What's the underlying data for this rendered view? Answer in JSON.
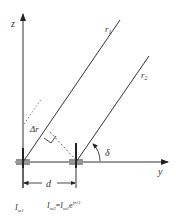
{
  "diagram": {
    "axes": {
      "vertical_label": "z",
      "horizontal_label": "y"
    },
    "rays": [
      {
        "label": "r",
        "subscript": "1"
      },
      {
        "label": "r",
        "subscript": "2"
      }
    ],
    "path_difference_label": "Δr",
    "angle_label": "δ",
    "spacing_label": "d",
    "currents": {
      "element1": {
        "symbol": "I",
        "subscript": "m1"
      },
      "element2_lhs": {
        "symbol": "I",
        "subscript": "m2"
      },
      "equals": "=",
      "element2_rhs": {
        "symbol": "I",
        "subscript": "m1"
      },
      "exp_base": "e",
      "exp_power": "jπ/2"
    },
    "colors": {
      "line": "#333333",
      "dotted": "#777777"
    }
  }
}
